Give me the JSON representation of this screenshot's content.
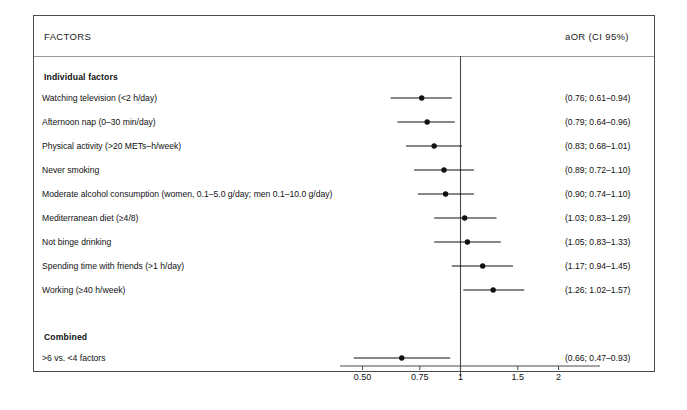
{
  "figure": {
    "title": "",
    "header": {
      "factors_label": "FACTORS",
      "aor_label": "aOR (CI 95%)"
    },
    "groups": [
      {
        "key": "individual",
        "label": "Individual factors"
      },
      {
        "key": "combined",
        "label": "Combined"
      }
    ]
  },
  "chart_data": {
    "type": "scatter",
    "subtype": "forest-plot",
    "title": "",
    "xlabel": "",
    "ylabel": "",
    "xscale": "log",
    "xlim": [
      0.45,
      2.15
    ],
    "xticks": [
      0.5,
      0.75,
      1,
      1.5,
      2
    ],
    "xticklabels": [
      "0.50",
      "0.75",
      "1",
      "1.5",
      "2"
    ],
    "reference_line": 1,
    "grid": false,
    "legend": null,
    "effect_measure": "aOR (CI 95%)",
    "sections": [
      {
        "name": "Individual factors",
        "rows": [
          {
            "label": "Watching television (<2 h/day)",
            "estimate": 0.76,
            "ci_low": 0.61,
            "ci_high": 0.94,
            "value_text": "(0.76; 0.61–0.94)"
          },
          {
            "label": "Afternoon nap (0–30 min/day)",
            "estimate": 0.79,
            "ci_low": 0.64,
            "ci_high": 0.96,
            "value_text": "(0.79; 0.64–0.96)"
          },
          {
            "label": "Physical activity (>20 METs–h/week)",
            "estimate": 0.83,
            "ci_low": 0.68,
            "ci_high": 1.01,
            "value_text": "(0.83; 0.68–1.01)"
          },
          {
            "label": "Never smoking",
            "estimate": 0.89,
            "ci_low": 0.72,
            "ci_high": 1.1,
            "value_text": "(0.89; 0.72–1.10)"
          },
          {
            "label": "Moderate alcohol consumption (women, 0.1–5.0 g/day; men 0.1–10.0 g/day)",
            "estimate": 0.9,
            "ci_low": 0.74,
            "ci_high": 1.1,
            "value_text": "(0.90; 0.74–1.10)"
          },
          {
            "label": "Mediterranean diet (≥4/8)",
            "estimate": 1.03,
            "ci_low": 0.83,
            "ci_high": 1.29,
            "value_text": "(1.03; 0.83–1.29)"
          },
          {
            "label": "Not binge drinking",
            "estimate": 1.05,
            "ci_low": 0.83,
            "ci_high": 1.33,
            "value_text": "(1.05; 0.83–1.33)"
          },
          {
            "label": "Spending time with friends (>1 h/day)",
            "estimate": 1.17,
            "ci_low": 0.94,
            "ci_high": 1.45,
            "value_text": "(1.17; 0.94–1.45)"
          },
          {
            "label": "Working (≥40 h/week)",
            "estimate": 1.26,
            "ci_low": 1.02,
            "ci_high": 1.57,
            "value_text": "(1.26; 1.02–1.57)"
          }
        ]
      },
      {
        "name": "Combined",
        "rows": [
          {
            "label": ">6 vs. <4 factors",
            "estimate": 0.66,
            "ci_low": 0.47,
            "ci_high": 0.93,
            "value_text": "(0.66; 0.47–0.93)"
          }
        ]
      }
    ]
  },
  "style": {
    "marker_color": "#111111",
    "line_color": "#111111",
    "axis_color": "#4a4a4a",
    "frame_color": "#4a4a4a"
  }
}
